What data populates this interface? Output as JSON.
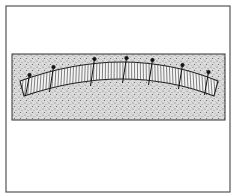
{
  "figure": {
    "colors": {
      "background": "#ffffff",
      "frame": "#555555",
      "stipple_bg": "#d9d9d9",
      "stipple_dot": "#6e6e6e",
      "band_fill": "#f4f4f4",
      "ink": "#222222"
    },
    "frame": {
      "x": 6,
      "y": 6,
      "w": 224,
      "h": 186
    },
    "stipple_box": {
      "x": 12,
      "y": 54,
      "w": 213,
      "h": 66
    },
    "band": {
      "outer_left": [
        20,
        81
      ],
      "outer_apex": [
        125,
        62
      ],
      "outer_right": [
        218,
        81
      ],
      "thickness": 15,
      "slat_count": 70
    },
    "nails": [
      {
        "x": 28,
        "head_y": 75,
        "tip_y": 96
      },
      {
        "x": 52,
        "head_y": 67,
        "tip_y": 92
      },
      {
        "x": 93,
        "head_y": 59,
        "tip_y": 86
      },
      {
        "x": 125,
        "head_y": 58,
        "tip_y": 83
      },
      {
        "x": 151,
        "head_y": 60,
        "tip_y": 85
      },
      {
        "x": 181,
        "head_y": 65,
        "tip_y": 89
      },
      {
        "x": 207,
        "head_y": 72,
        "tip_y": 95
      }
    ]
  }
}
